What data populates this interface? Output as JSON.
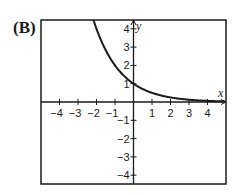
{
  "panel_label": "(B)",
  "chart_data": {
    "type": "line",
    "title": "",
    "xlabel": "x",
    "ylabel": "y",
    "xlim": [
      -5,
      5
    ],
    "ylim": [
      -4.5,
      4.5
    ],
    "grid": false,
    "x_ticks": [
      -4,
      -3,
      -2,
      -1,
      1,
      2,
      3,
      4
    ],
    "y_ticks": [
      4,
      3,
      2,
      1,
      -1,
      -2,
      -3,
      -4
    ],
    "x_tick_labels": [
      "−4",
      "−3",
      "−2",
      "−1",
      "1",
      "2",
      "3",
      "4"
    ],
    "y_tick_labels": [
      "4",
      "3",
      "2",
      "1",
      "−1",
      "−2",
      "−3",
      "−4"
    ],
    "series": [
      {
        "name": "y = 2^(-x)",
        "x": [
          -2.1,
          -2,
          -1.5,
          -1,
          -0.5,
          0,
          0.5,
          1,
          1.5,
          2,
          2.5,
          3,
          3.5,
          4,
          4.5,
          4.9
        ],
        "values": [
          4.29,
          4,
          2.83,
          2,
          1.41,
          1,
          0.71,
          0.5,
          0.35,
          0.25,
          0.18,
          0.125,
          0.09,
          0.06,
          0.04,
          0.03
        ]
      }
    ],
    "colors": {
      "curve": "#1a1a1a",
      "axes": "#1a1a1a",
      "frame": "#1a1a1a"
    }
  }
}
